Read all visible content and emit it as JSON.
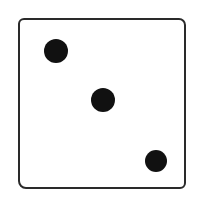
{
  "die": {
    "face_value": "3",
    "border_color": "#2a2a2a",
    "pip_color": "#111111",
    "pips": [
      {
        "position": "top-left",
        "cx": 56,
        "cy": 51,
        "r": 12
      },
      {
        "position": "center",
        "cx": 103,
        "cy": 100,
        "r": 12
      },
      {
        "position": "bottom-right",
        "cx": 156,
        "cy": 161,
        "r": 11
      }
    ]
  }
}
